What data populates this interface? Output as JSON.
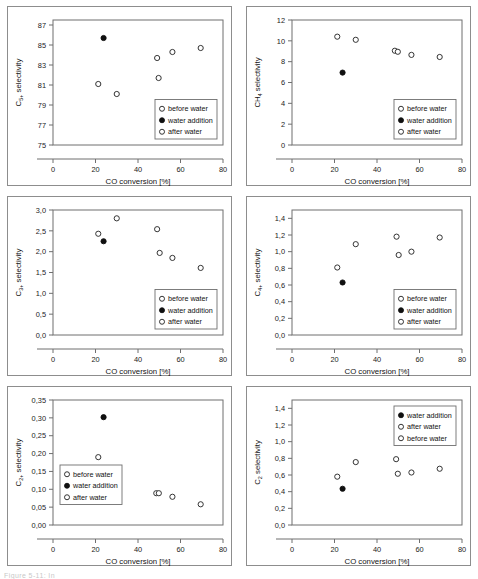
{
  "figure": {
    "caption_fragment": "Figure 5-11: In",
    "xlabel": "CO conversion [%]",
    "legend_items": [
      {
        "key": "before",
        "label": "before water",
        "marker": "open"
      },
      {
        "key": "addition",
        "label": "water addition",
        "marker": "filled"
      },
      {
        "key": "after",
        "label": "after water",
        "marker": "open"
      }
    ]
  },
  "chart_data": [
    {
      "id": "c5plus",
      "type": "scatter",
      "title": "",
      "ylabel_main": "C",
      "ylabel_sub": "5+",
      "ylabel_tail": " selectivity",
      "ylabel": "C5+ selectivity",
      "xlabel": "CO conversion [%]",
      "xlim": [
        0,
        80
      ],
      "ylim": [
        75,
        87.5
      ],
      "xticks": [
        0,
        20,
        40,
        60,
        80
      ],
      "yticks": [
        75,
        77,
        79,
        81,
        83,
        85,
        87
      ],
      "ytick_labels": [
        "75",
        "77",
        "79",
        "81",
        "83",
        "85",
        "87"
      ],
      "grid": false,
      "legend_position": "bottom-right",
      "legend_order": [
        "before",
        "addition",
        "after"
      ],
      "series": [
        {
          "name": "before water",
          "marker": "open",
          "points": [
            [
              21.3,
              81.1
            ],
            [
              30.0,
              80.1
            ]
          ]
        },
        {
          "name": "water addition",
          "marker": "filled",
          "points": [
            [
              23.8,
              85.7
            ]
          ]
        },
        {
          "name": "after water",
          "marker": "open",
          "points": [
            [
              49.0,
              83.7
            ],
            [
              49.7,
              81.7
            ],
            [
              56.2,
              84.3
            ],
            [
              69.5,
              84.7
            ]
          ]
        }
      ]
    },
    {
      "id": "ch4",
      "type": "scatter",
      "title": "",
      "ylabel_main": "CH",
      "ylabel_sub": "4",
      "ylabel_tail": " selectivity",
      "ylabel": "CH4 selectivity",
      "xlabel": "CO conversion [%]",
      "xlim": [
        0,
        80
      ],
      "ylim": [
        0,
        12
      ],
      "xticks": [
        0,
        20,
        40,
        60,
        80
      ],
      "yticks": [
        0,
        2,
        4,
        6,
        8,
        10,
        12
      ],
      "ytick_labels": [
        "0",
        "2",
        "4",
        "6",
        "8",
        "10",
        "12"
      ],
      "grid": false,
      "legend_position": "bottom-right",
      "legend_order": [
        "before",
        "addition",
        "after"
      ],
      "series": [
        {
          "name": "before water",
          "marker": "open",
          "points": [
            [
              21.3,
              10.4
            ],
            [
              30.0,
              10.1
            ]
          ]
        },
        {
          "name": "water addition",
          "marker": "filled",
          "points": [
            [
              23.8,
              6.95
            ]
          ]
        },
        {
          "name": "after water",
          "marker": "open",
          "points": [
            [
              48.4,
              9.05
            ],
            [
              49.8,
              8.95
            ],
            [
              56.2,
              8.65
            ],
            [
              69.5,
              8.45
            ]
          ]
        }
      ]
    },
    {
      "id": "c3plus",
      "type": "scatter",
      "title": "",
      "ylabel_main": "C",
      "ylabel_sub": "3+",
      "ylabel_tail": " selectivity",
      "ylabel": "C3+ selectivity",
      "xlabel": "CO conversion [%]",
      "xlim": [
        0,
        80
      ],
      "ylim": [
        0.0,
        3.0
      ],
      "xticks": [
        0,
        20,
        40,
        60,
        80
      ],
      "yticks": [
        0.0,
        0.5,
        1.0,
        1.5,
        2.0,
        2.5,
        3.0
      ],
      "ytick_labels": [
        "0,0",
        "0,5",
        "1,0",
        "1,5",
        "2,0",
        "2,5",
        "3,0"
      ],
      "grid": false,
      "legend_position": "bottom-right",
      "legend_order": [
        "before",
        "addition",
        "after"
      ],
      "series": [
        {
          "name": "before water",
          "marker": "open",
          "points": [
            [
              21.3,
              2.43
            ],
            [
              30.0,
              2.8
            ]
          ]
        },
        {
          "name": "water addition",
          "marker": "filled",
          "points": [
            [
              23.8,
              2.25
            ]
          ]
        },
        {
          "name": "after water",
          "marker": "open",
          "points": [
            [
              49.0,
              2.54
            ],
            [
              50.2,
              1.97
            ],
            [
              56.2,
              1.85
            ],
            [
              69.5,
              1.61
            ]
          ]
        }
      ]
    },
    {
      "id": "c4plus",
      "type": "scatter",
      "title": "",
      "ylabel_main": "C",
      "ylabel_sub": "4+",
      "ylabel_tail": " selectivity",
      "ylabel": "C4+ selectivity",
      "xlabel": "CO conversion [%]",
      "xlim": [
        0,
        80
      ],
      "ylim": [
        0.0,
        1.5
      ],
      "xticks": [
        0,
        20,
        40,
        60,
        80
      ],
      "yticks": [
        0.0,
        0.2,
        0.4,
        0.6,
        0.8,
        1.0,
        1.2,
        1.4
      ],
      "ytick_labels": [
        "0,0",
        "0,2",
        "0,4",
        "0,6",
        "0,8",
        "1,0",
        "1,2",
        "1,4"
      ],
      "grid": false,
      "legend_position": "bottom-right",
      "legend_order": [
        "before",
        "addition",
        "after"
      ],
      "series": [
        {
          "name": "before water",
          "marker": "open",
          "points": [
            [
              21.3,
              0.81
            ],
            [
              30.0,
              1.09
            ]
          ]
        },
        {
          "name": "water addition",
          "marker": "filled",
          "points": [
            [
              23.8,
              0.63
            ]
          ]
        },
        {
          "name": "after water",
          "marker": "open",
          "points": [
            [
              49.2,
              1.18
            ],
            [
              50.2,
              0.96
            ],
            [
              56.2,
              1.0
            ],
            [
              69.5,
              1.17
            ]
          ]
        }
      ]
    },
    {
      "id": "c2plus",
      "type": "scatter",
      "title": "",
      "ylabel_main": "C",
      "ylabel_sub": "2+",
      "ylabel_tail": " selectivity",
      "ylabel": "C2+ selectivity",
      "xlabel": "CO conversion [%]",
      "xlim": [
        0,
        80
      ],
      "ylim": [
        0.0,
        0.35
      ],
      "xticks": [
        0,
        20,
        40,
        60,
        80
      ],
      "yticks": [
        0.0,
        0.05,
        0.1,
        0.15,
        0.2,
        0.25,
        0.3,
        0.35
      ],
      "ytick_labels": [
        "0,00",
        "0,05",
        "0,10",
        "0,15",
        "0,20",
        "0,25",
        "0,30",
        "0,35"
      ],
      "grid": false,
      "legend_position": "center-left",
      "legend_order": [
        "before",
        "addition",
        "after"
      ],
      "series": [
        {
          "name": "before water",
          "marker": "open",
          "points": [
            [
              21.3,
              0.19
            ],
            [
              30.0,
              0.14
            ]
          ]
        },
        {
          "name": "water addition",
          "marker": "filled",
          "points": [
            [
              23.8,
              0.302
            ]
          ]
        },
        {
          "name": "after water",
          "marker": "open",
          "points": [
            [
              48.6,
              0.089
            ],
            [
              49.8,
              0.089
            ],
            [
              56.2,
              0.079
            ],
            [
              69.5,
              0.058
            ]
          ]
        }
      ]
    },
    {
      "id": "c2",
      "type": "scatter",
      "title": "",
      "ylabel_main": "C",
      "ylabel_sub": "2",
      "ylabel_tail": " selectivity",
      "ylabel": "C2 selectivity",
      "xlabel": "CO conversion [%]",
      "xlim": [
        0,
        80
      ],
      "ylim": [
        0.0,
        1.5
      ],
      "xticks": [
        0,
        20,
        40,
        60,
        80
      ],
      "yticks": [
        0.0,
        0.2,
        0.4,
        0.6,
        0.8,
        1.0,
        1.2,
        1.4
      ],
      "ytick_labels": [
        "0,0",
        "0,2",
        "0,4",
        "0,6",
        "0,8",
        "1,0",
        "1,2",
        "1,4"
      ],
      "grid": false,
      "legend_position": "top-right",
      "legend_order": [
        "addition",
        "after",
        "before"
      ],
      "series": [
        {
          "name": "before water",
          "marker": "open",
          "points": [
            [
              21.3,
              0.58
            ],
            [
              30.0,
              0.755
            ]
          ]
        },
        {
          "name": "water addition",
          "marker": "filled",
          "points": [
            [
              23.8,
              0.435
            ]
          ]
        },
        {
          "name": "after water",
          "marker": "open",
          "points": [
            [
              49.0,
              0.79
            ],
            [
              49.8,
              0.615
            ],
            [
              56.2,
              0.63
            ],
            [
              69.5,
              0.675
            ]
          ]
        }
      ]
    }
  ]
}
